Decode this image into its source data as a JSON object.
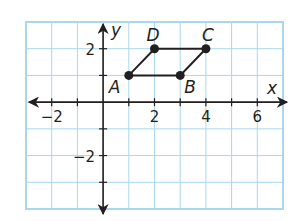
{
  "figure": {
    "type": "coordinate-plane",
    "grid": {
      "xmin": -3,
      "xmax": 7,
      "ymin": -4,
      "ymax": 3,
      "step": 1,
      "color": "#a9d7ee",
      "border_color": "#a9d7ee"
    },
    "axes": {
      "x_label": "x",
      "y_label": "y",
      "x_ticks": [
        -2,
        2,
        4,
        6
      ],
      "y_ticks": [
        2,
        -2
      ],
      "x_tick_labels": [
        "−2",
        "2",
        "4",
        "6"
      ],
      "y_tick_labels": [
        "2",
        "−2"
      ],
      "color": "#231f20"
    },
    "points": [
      {
        "name": "A",
        "x": 1,
        "y": 1
      },
      {
        "name": "B",
        "x": 3,
        "y": 1
      },
      {
        "name": "C",
        "x": 4,
        "y": 2
      },
      {
        "name": "D",
        "x": 2,
        "y": 2
      }
    ],
    "polygon": [
      "A",
      "B",
      "C",
      "D"
    ],
    "shape_color": "#231f20"
  },
  "chart_data": {
    "type": "scatter",
    "title": "",
    "xlabel": "x",
    "ylabel": "y",
    "xlim": [
      -3,
      7
    ],
    "ylim": [
      -4,
      3
    ],
    "grid": true,
    "series": [
      {
        "name": "parallelogram ABCD",
        "points": [
          {
            "label": "A",
            "x": 1,
            "y": 1
          },
          {
            "label": "B",
            "x": 3,
            "y": 1
          },
          {
            "label": "C",
            "x": 4,
            "y": 2
          },
          {
            "label": "D",
            "x": 2,
            "y": 2
          }
        ],
        "closed": true
      }
    ],
    "x_ticks": [
      -2,
      2,
      4,
      6
    ],
    "y_ticks": [
      -2,
      2
    ]
  }
}
